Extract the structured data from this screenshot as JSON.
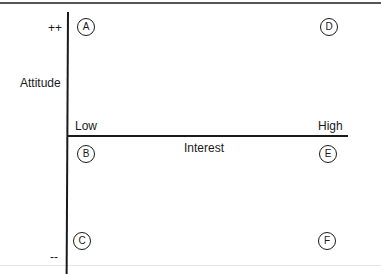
{
  "diagram": {
    "y_axis": {
      "label": "Attitude",
      "top_label": "++",
      "bottom_label": "--"
    },
    "x_axis": {
      "label": "Interest",
      "left_label": "Low",
      "right_label": "High"
    },
    "points": [
      {
        "id": "A",
        "label": "A",
        "position": "high attitude, low interest"
      },
      {
        "id": "D",
        "label": "D",
        "position": "high attitude, high interest"
      },
      {
        "id": "B",
        "label": "B",
        "position": "neutral attitude, low interest"
      },
      {
        "id": "E",
        "label": "E",
        "position": "neutral attitude, high interest"
      },
      {
        "id": "C",
        "label": "C",
        "position": "negative attitude, low interest"
      },
      {
        "id": "F",
        "label": "F",
        "position": "negative attitude, high interest"
      }
    ]
  }
}
